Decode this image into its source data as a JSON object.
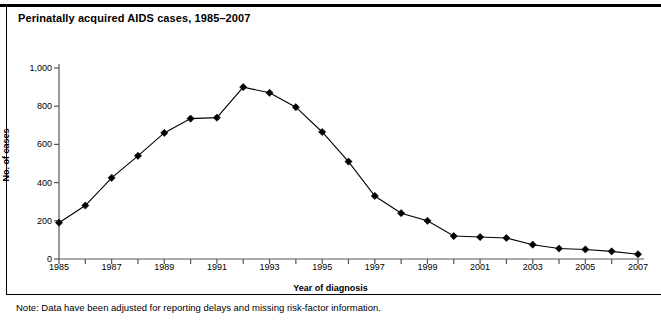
{
  "figure": {
    "title": "Perinatally acquired AIDS cases, 1985–2007",
    "note": "Note: Data have been adjusted for reporting delays and missing risk-factor information."
  },
  "chart_data": {
    "type": "line",
    "title": "Perinatally acquired AIDS cases, 1985–2007",
    "xlabel": "Year of diagnosis",
    "ylabel": "No. of cases",
    "xlim": [
      1985,
      2007
    ],
    "ylim": [
      0,
      1000
    ],
    "grid": false,
    "legend": null,
    "marker": "diamond",
    "line_color": "#000000",
    "marker_color": "#000000",
    "y_ticks": [
      0,
      200,
      400,
      600,
      800,
      1000
    ],
    "y_tick_labels": [
      "0",
      "200",
      "400",
      "600",
      "800",
      "1,000"
    ],
    "x_ticks": [
      1985,
      1986,
      1987,
      1988,
      1989,
      1990,
      1991,
      1992,
      1993,
      1994,
      1995,
      1996,
      1997,
      1998,
      1999,
      2000,
      2001,
      2002,
      2003,
      2004,
      2005,
      2006,
      2007
    ],
    "x_tick_labels": [
      "1985",
      "",
      "1987",
      "",
      "1989",
      "",
      "1991",
      "",
      "1993",
      "",
      "1995",
      "",
      "1997",
      "",
      "1999",
      "",
      "2001",
      "",
      "2003",
      "",
      "2005",
      "",
      "2007"
    ],
    "x": [
      1985,
      1986,
      1987,
      1988,
      1989,
      1990,
      1991,
      1992,
      1993,
      1994,
      1995,
      1996,
      1997,
      1998,
      1999,
      2000,
      2001,
      2002,
      2003,
      2004,
      2005,
      2006,
      2007
    ],
    "values": [
      190,
      280,
      425,
      540,
      660,
      735,
      740,
      900,
      870,
      795,
      665,
      510,
      330,
      240,
      200,
      120,
      115,
      110,
      75,
      55,
      50,
      40,
      25
    ],
    "annotations": [
      "Note: Data have been adjusted for reporting delays and missing risk-factor information."
    ]
  }
}
